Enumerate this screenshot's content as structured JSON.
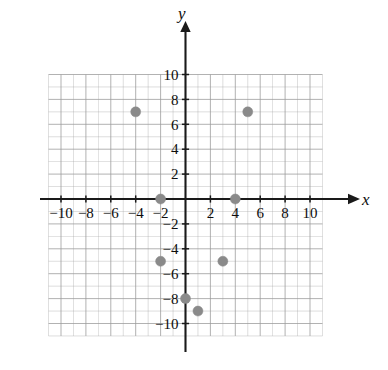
{
  "figure": {
    "kind": "coordinate-plane-scatter",
    "background_color": "#ffffff"
  },
  "axes": {
    "x_axis_label": "x",
    "y_axis_label": "y",
    "axis_color": "#1a1a1a",
    "grid_color": "#9b9b9b",
    "x_tick_labels": [
      "−10",
      "−8",
      "−6",
      "−4",
      "−2",
      "2",
      "4",
      "6",
      "8",
      "10"
    ],
    "x_tick_values": [
      -10,
      -8,
      -6,
      -4,
      -2,
      2,
      4,
      6,
      8,
      10
    ],
    "y_tick_labels": [
      "10",
      "8",
      "6",
      "4",
      "2",
      "−2",
      "−4",
      "−6",
      "−8",
      "−10"
    ],
    "y_tick_values": [
      10,
      8,
      6,
      4,
      2,
      -2,
      -4,
      -6,
      -8,
      -10
    ]
  },
  "chart_data": {
    "type": "scatter",
    "title": "",
    "xlabel": "x",
    "ylabel": "y",
    "xlim": [
      -11,
      11
    ],
    "ylim": [
      -11,
      10
    ],
    "grid": true,
    "legend": "none",
    "point_color": "#8a8a8a",
    "point_radius": 5,
    "points": [
      {
        "x": -4,
        "y": 7
      },
      {
        "x": 5,
        "y": 7
      },
      {
        "x": -2,
        "y": 0
      },
      {
        "x": 4,
        "y": 0
      },
      {
        "x": -2,
        "y": -5
      },
      {
        "x": 3,
        "y": -5
      },
      {
        "x": 0,
        "y": -8
      },
      {
        "x": 1,
        "y": -9
      }
    ],
    "x": [
      -4,
      5,
      -2,
      4,
      -2,
      3,
      0,
      1
    ],
    "y": [
      7,
      7,
      0,
      0,
      -5,
      -5,
      -8,
      -9
    ]
  }
}
